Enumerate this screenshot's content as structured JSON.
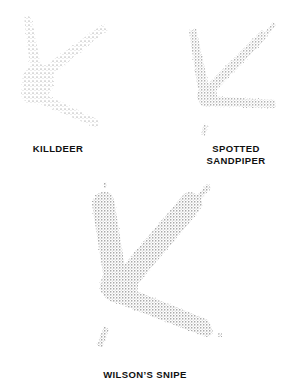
{
  "plate": {
    "title": "Shorebird Track Identification Plate",
    "background_color": "#ffffff",
    "ink_color": "#6e6e6e",
    "label_color": "#101010",
    "width": 289,
    "height": 388
  },
  "figures": [
    {
      "id": "killdeer",
      "label": "KILLDEER",
      "label_lines": "KILLDEER",
      "toe_count": 3,
      "has_hind_toe_mark": false,
      "texture": "stipple",
      "description": "Three-toed shorebird track, fine sparse stipple, slender toes",
      "bbox": {
        "x": 14,
        "y": 14,
        "width": 94,
        "height": 118
      }
    },
    {
      "id": "spotted-sandpiper",
      "label": "SPOTTED SANDPIPER",
      "label_lines": "SPOTTED\nSANDPIPER",
      "toe_count": 3,
      "has_hind_toe_mark": true,
      "texture": "stipple",
      "description": "Three-toed track with small hind toe mark below heel, outer toe nearly horizontal",
      "bbox": {
        "x": 190,
        "y": 26,
        "width": 92,
        "height": 106
      }
    },
    {
      "id": "wilsons-snipe",
      "label": "WILSON’S SNIPE",
      "label_lines": "WILSON’S SNIPE",
      "toe_count": 3,
      "has_hind_toe_mark": true,
      "texture": "stipple",
      "description": "Large three-toed track, thick heavy toes, small hind toe mark and claw tips",
      "bbox": {
        "x": 82,
        "y": 186,
        "width": 132,
        "height": 170
      }
    }
  ],
  "marks": {
    "claw_tip": "claw-tip-mark",
    "hind_toe": "hind-toe-mark"
  }
}
